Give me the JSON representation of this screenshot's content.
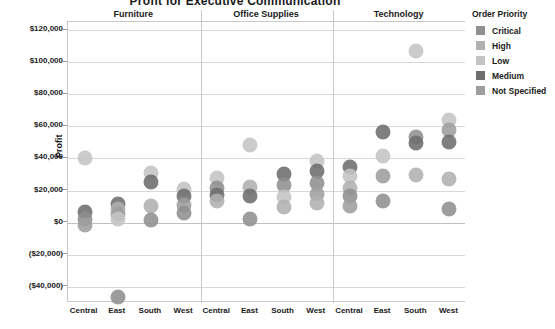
{
  "chart_data": {
    "type": "scatter",
    "title": "Profit for Executive Communication",
    "xlabel": "",
    "ylabel": "Profit",
    "ylim": [
      -50000,
      120000
    ],
    "yticks": [
      120000,
      100000,
      80000,
      60000,
      40000,
      20000,
      0,
      -20000,
      -40000
    ],
    "ytick_labels": [
      "$120,000",
      "$100,000",
      "$80,000",
      "$60,000",
      "$40,000",
      "$20,000",
      "$0",
      "($20,000)",
      "($40,000)"
    ],
    "grid": true,
    "panels": [
      "Furniture",
      "Office Supplies",
      "Technology"
    ],
    "categories": [
      "Central",
      "East",
      "South",
      "West"
    ],
    "legend": {
      "title": "Order Priority",
      "position": "right",
      "entries": [
        {
          "label": "Critical",
          "color": "#8f8f8f"
        },
        {
          "label": "High",
          "color": "#b0b0b0"
        },
        {
          "label": "Low",
          "color": "#c4c4c4"
        },
        {
          "label": "Medium",
          "color": "#6d6d6d"
        },
        {
          "label": "Not Specified",
          "color": "#9e9e9e"
        }
      ]
    },
    "points": [
      {
        "panel": "Furniture",
        "region": "Central",
        "priority": "Low",
        "profit": 40000
      },
      {
        "panel": "Furniture",
        "region": "Central",
        "priority": "Medium",
        "profit": 6500
      },
      {
        "panel": "Furniture",
        "region": "Central",
        "priority": "Critical",
        "profit": 2500
      },
      {
        "panel": "Furniture",
        "region": "Central",
        "priority": "Not Specified",
        "profit": -1500
      },
      {
        "panel": "Furniture",
        "region": "East",
        "priority": "Medium",
        "profit": 11500
      },
      {
        "panel": "Furniture",
        "region": "East",
        "priority": "High",
        "profit": 8500
      },
      {
        "panel": "Furniture",
        "region": "East",
        "priority": "Not Specified",
        "profit": 5500
      },
      {
        "panel": "Furniture",
        "region": "East",
        "priority": "Low",
        "profit": 2500
      },
      {
        "panel": "Furniture",
        "region": "East",
        "priority": "Critical",
        "profit": -46000
      },
      {
        "panel": "Furniture",
        "region": "South",
        "priority": "Low",
        "profit": 31000
      },
      {
        "panel": "Furniture",
        "region": "South",
        "priority": "Medium",
        "profit": 25500
      },
      {
        "panel": "Furniture",
        "region": "South",
        "priority": "High",
        "profit": 10500
      },
      {
        "panel": "Furniture",
        "region": "South",
        "priority": "Critical",
        "profit": 1500
      },
      {
        "panel": "Furniture",
        "region": "West",
        "priority": "Low",
        "profit": 21000
      },
      {
        "panel": "Furniture",
        "region": "West",
        "priority": "Medium",
        "profit": 16500
      },
      {
        "panel": "Furniture",
        "region": "West",
        "priority": "Not Specified",
        "profit": 11000
      },
      {
        "panel": "Furniture",
        "region": "West",
        "priority": "Critical",
        "profit": 6000
      },
      {
        "panel": "Office Supplies",
        "region": "Central",
        "priority": "Low",
        "profit": 28000
      },
      {
        "panel": "Office Supplies",
        "region": "Central",
        "priority": "Critical",
        "profit": 21500
      },
      {
        "panel": "Office Supplies",
        "region": "Central",
        "priority": "Medium",
        "profit": 17500
      },
      {
        "panel": "Office Supplies",
        "region": "Central",
        "priority": "High",
        "profit": 13500
      },
      {
        "panel": "Office Supplies",
        "region": "East",
        "priority": "Low",
        "profit": 48500
      },
      {
        "panel": "Office Supplies",
        "region": "East",
        "priority": "High",
        "profit": 22500
      },
      {
        "panel": "Office Supplies",
        "region": "East",
        "priority": "Medium",
        "profit": 16500
      },
      {
        "panel": "Office Supplies",
        "region": "East",
        "priority": "Critical",
        "profit": 2500
      },
      {
        "panel": "Office Supplies",
        "region": "South",
        "priority": "Medium",
        "profit": 30500
      },
      {
        "panel": "Office Supplies",
        "region": "South",
        "priority": "Critical",
        "profit": 23500
      },
      {
        "panel": "Office Supplies",
        "region": "South",
        "priority": "Low",
        "profit": 16000
      },
      {
        "panel": "Office Supplies",
        "region": "South",
        "priority": "High",
        "profit": 10000
      },
      {
        "panel": "Office Supplies",
        "region": "West",
        "priority": "Low",
        "profit": 38500
      },
      {
        "panel": "Office Supplies",
        "region": "West",
        "priority": "Medium",
        "profit": 32000
      },
      {
        "panel": "Office Supplies",
        "region": "West",
        "priority": "Critical",
        "profit": 24500
      },
      {
        "panel": "Office Supplies",
        "region": "West",
        "priority": "Not Specified",
        "profit": 18000
      },
      {
        "panel": "Office Supplies",
        "region": "West",
        "priority": "High",
        "profit": 12000
      },
      {
        "panel": "Technology",
        "region": "Central",
        "priority": "Medium",
        "profit": 35000
      },
      {
        "panel": "Technology",
        "region": "Central",
        "priority": "Low",
        "profit": 29000
      },
      {
        "panel": "Technology",
        "region": "Central",
        "priority": "High",
        "profit": 21500
      },
      {
        "panel": "Technology",
        "region": "Central",
        "priority": "Critical",
        "profit": 16500
      },
      {
        "panel": "Technology",
        "region": "Central",
        "priority": "Not Specified",
        "profit": 10500
      },
      {
        "panel": "Technology",
        "region": "East",
        "priority": "Medium",
        "profit": 56500
      },
      {
        "panel": "Technology",
        "region": "East",
        "priority": "Low",
        "profit": 41500
      },
      {
        "panel": "Technology",
        "region": "East",
        "priority": "Not Specified",
        "profit": 29000
      },
      {
        "panel": "Technology",
        "region": "East",
        "priority": "Critical",
        "profit": 13500
      },
      {
        "panel": "Technology",
        "region": "South",
        "priority": "Low",
        "profit": 107000
      },
      {
        "panel": "Technology",
        "region": "South",
        "priority": "Critical",
        "profit": 53500
      },
      {
        "panel": "Technology",
        "region": "South",
        "priority": "Medium",
        "profit": 49500
      },
      {
        "panel": "Technology",
        "region": "South",
        "priority": "High",
        "profit": 29500
      },
      {
        "panel": "Technology",
        "region": "West",
        "priority": "Low",
        "profit": 64000
      },
      {
        "panel": "Technology",
        "region": "West",
        "priority": "Not Specified",
        "profit": 57500
      },
      {
        "panel": "Technology",
        "region": "West",
        "priority": "Medium",
        "profit": 50500
      },
      {
        "panel": "Technology",
        "region": "West",
        "priority": "High",
        "profit": 27500
      },
      {
        "panel": "Technology",
        "region": "West",
        "priority": "Critical",
        "profit": 8500
      }
    ]
  }
}
